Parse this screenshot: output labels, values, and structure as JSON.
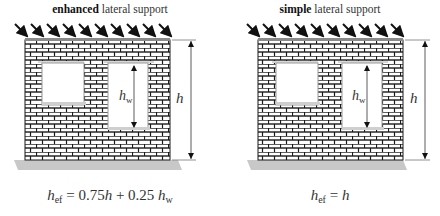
{
  "panels": [
    {
      "title_bold": "enhanced",
      "title_rest": " lateral support",
      "h_label": "h",
      "hw_label": "h",
      "hw_sub": "w",
      "formula": {
        "lhs": "h",
        "lhs_sub": "ef",
        "eq": " = ",
        "t1": "0.75",
        "t1_var": "h",
        "plus": " + 0.25 ",
        "t2_var": "h",
        "t2_sub": "w"
      }
    },
    {
      "title_bold": "simple",
      "title_rest": " lateral support",
      "h_label": "h",
      "hw_label": "h",
      "hw_sub": "w",
      "formula": {
        "lhs": "h",
        "lhs_sub": "ef",
        "eq": " = ",
        "rhs_var": "h"
      }
    }
  ],
  "colors": {
    "brick_line": "#1a1a1a",
    "mortar": "#ffffff",
    "ground": "#c8c8c8",
    "top_band": "#8a8a8a",
    "arrow": "#111111"
  }
}
